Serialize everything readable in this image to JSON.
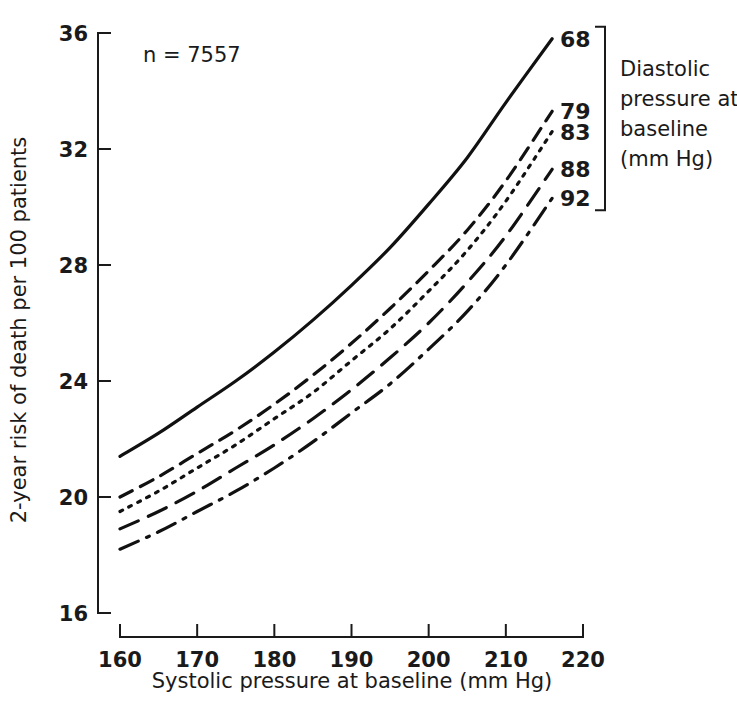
{
  "figure": {
    "annotation": "n = 7557",
    "background": "#ffffff",
    "line_color": "#111111"
  },
  "legend": {
    "title_lines": [
      "Diastolic",
      "pressure at",
      "baseline",
      "(mm Hg)"
    ],
    "title_full": "Diastolic pressure at baseline (mm Hg)",
    "entries": [
      {
        "label": "68",
        "style": "solid"
      },
      {
        "label": "79",
        "style": "dashed"
      },
      {
        "label": "83",
        "style": "dotted"
      },
      {
        "label": "88",
        "style": "long-dashed"
      },
      {
        "label": "92",
        "style": "dash-dot"
      }
    ]
  },
  "chart_data": {
    "type": "line",
    "title": "",
    "xlabel": "Systolic pressure at baseline (mm Hg)",
    "ylabel": "2-year risk of death per 100 patients",
    "xlim": [
      160,
      220
    ],
    "ylim": [
      16,
      36
    ],
    "xticks": [
      160,
      170,
      180,
      190,
      200,
      210,
      220
    ],
    "yticks": [
      16,
      20,
      24,
      28,
      32,
      36
    ],
    "xtick_labels": [
      "160",
      "170",
      "180",
      "190",
      "200",
      "210",
      "220"
    ],
    "ytick_labels": [
      "16",
      "20",
      "24",
      "28",
      "32",
      "36"
    ],
    "grid": false,
    "legend_position": "right",
    "annotations": [
      "n = 7557"
    ],
    "x": [
      160,
      165,
      170,
      175,
      180,
      185,
      190,
      195,
      200,
      205,
      210,
      216
    ],
    "series": [
      {
        "name": "68",
        "style": "solid",
        "values": [
          21.4,
          22.2,
          23.1,
          24.0,
          25.0,
          26.1,
          27.3,
          28.6,
          30.1,
          31.7,
          33.6,
          35.8
        ]
      },
      {
        "name": "79",
        "style": "dashed",
        "values": [
          20.0,
          20.7,
          21.5,
          22.3,
          23.2,
          24.2,
          25.3,
          26.5,
          27.8,
          29.2,
          30.9,
          33.3
        ]
      },
      {
        "name": "83",
        "style": "dotted",
        "values": [
          19.5,
          20.2,
          21.0,
          21.8,
          22.7,
          23.6,
          24.7,
          25.8,
          27.1,
          28.5,
          30.2,
          32.6
        ]
      },
      {
        "name": "88",
        "style": "long-dashed",
        "values": [
          18.9,
          19.5,
          20.2,
          21.0,
          21.8,
          22.7,
          23.7,
          24.8,
          26.0,
          27.4,
          29.0,
          31.3
        ]
      },
      {
        "name": "92",
        "style": "dash-dot",
        "values": [
          18.2,
          18.8,
          19.5,
          20.2,
          21.0,
          21.9,
          22.9,
          23.9,
          25.1,
          26.4,
          28.0,
          30.3
        ]
      }
    ]
  }
}
